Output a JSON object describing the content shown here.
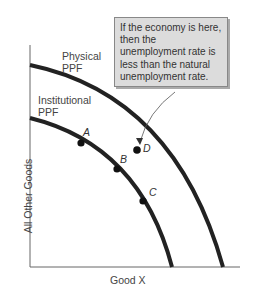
{
  "diagram": {
    "type": "production possibilities frontier",
    "axes": {
      "x_label": "Good X",
      "y_label": "All Other Goods"
    },
    "curves": [
      {
        "name": "physical-ppf",
        "label_line1": "Physical",
        "label_line2": "PPF"
      },
      {
        "name": "institutional-ppf",
        "label_line1": "Institutional",
        "label_line2": "PPF"
      }
    ],
    "points": [
      {
        "label": "A",
        "on": "institutional-ppf"
      },
      {
        "label": "B",
        "on": "institutional-ppf"
      },
      {
        "label": "C",
        "on": "institutional-ppf"
      },
      {
        "label": "D",
        "on": "between curves"
      }
    ],
    "callout": {
      "text": "If the economy is here, then the unemployment rate is less than the natural unemployment rate.",
      "points_to": "D"
    },
    "colors": {
      "curve": "#222222",
      "callout_bg": "#dcdcdc"
    }
  }
}
